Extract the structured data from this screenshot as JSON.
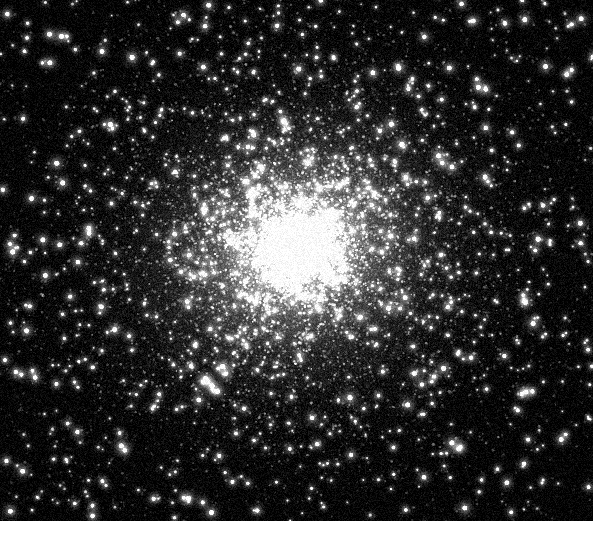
{
  "image": {
    "subject": "globular-star-cluster",
    "modality": "grayscale-astronomical-photograph",
    "plate": {
      "x": 0,
      "y": 0,
      "width": 593,
      "height": 521
    },
    "canvas_width": 593,
    "canvas_height": 521,
    "background_color": "#000000",
    "core_color": "#a8a8a8",
    "halo_color": "#6e6e6e",
    "corner_color": "#070707",
    "star_color": "#ffffff"
  },
  "cluster": {
    "center_x": 296,
    "center_y": 248,
    "core_radius": 92,
    "halo_radius": 250,
    "outer_radius": 430,
    "ellipse_ratio_x": 1.08,
    "ellipse_ratio_y": 0.94,
    "rotation_deg": -18,
    "halo_layers": [
      {
        "radius": 70,
        "alpha": 0.62,
        "gray": 170
      },
      {
        "radius": 115,
        "alpha": 0.46,
        "gray": 150
      },
      {
        "radius": 165,
        "alpha": 0.34,
        "gray": 126
      },
      {
        "radius": 225,
        "alpha": 0.24,
        "gray": 100
      },
      {
        "radius": 300,
        "alpha": 0.15,
        "gray": 72
      },
      {
        "radius": 400,
        "alpha": 0.08,
        "gray": 46
      }
    ]
  },
  "star_field": {
    "random_seed": 20240517,
    "populations": [
      {
        "name": "unresolved-dense-core-stars",
        "count": 52000,
        "min_radius": 0.35,
        "max_radius": 0.95,
        "min_brightness": 0.1,
        "max_brightness": 0.48,
        "concentration": 2.35,
        "glow": false
      },
      {
        "name": "resolved-cluster-members",
        "count": 9000,
        "min_radius": 0.7,
        "max_radius": 1.5,
        "min_brightness": 0.3,
        "max_brightness": 0.82,
        "concentration": 1.75,
        "glow": false
      },
      {
        "name": "bright-giant-stars",
        "count": 1400,
        "min_radius": 1.3,
        "max_radius": 2.7,
        "min_brightness": 0.72,
        "max_brightness": 1.0,
        "concentration": 1.15,
        "glow": true
      },
      {
        "name": "foreground-field-stars",
        "count": 260,
        "min_radius": 2.1,
        "max_radius": 4.0,
        "min_brightness": 0.88,
        "max_brightness": 1.0,
        "concentration": 0.0,
        "glow": true
      }
    ],
    "noise": {
      "amount": 0.085,
      "grain_scale": 1
    }
  },
  "caption": {
    "text": "",
    "visible": false
  }
}
